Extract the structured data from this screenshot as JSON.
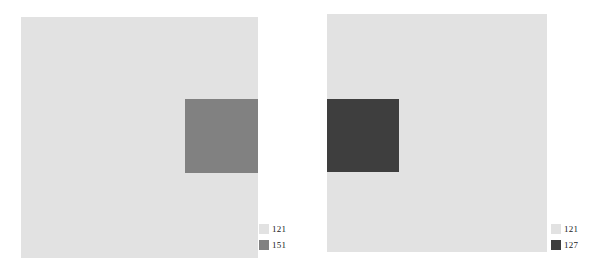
{
  "panels": [
    {
      "id": "left",
      "colors": {
        "background": "#e2e2e2",
        "inner": "#818181"
      },
      "legend": [
        {
          "label": "121",
          "color": "#e2e2e2"
        },
        {
          "label": "151",
          "color": "#818181"
        }
      ]
    },
    {
      "id": "right",
      "colors": {
        "background": "#e2e2e2",
        "inner": "#3e3e3e"
      },
      "legend": [
        {
          "label": "121",
          "color": "#e2e2e2"
        },
        {
          "label": "127",
          "color": "#3e3e3e"
        }
      ]
    }
  ]
}
